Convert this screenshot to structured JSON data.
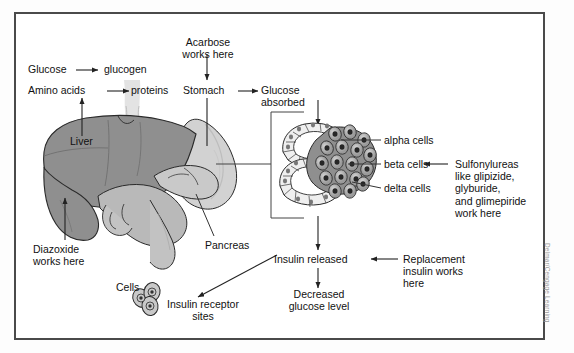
{
  "figure": {
    "credit": "Delmar/Cengage Learning",
    "border_color": "#4a4a4a",
    "background": "#ffffff"
  },
  "palette": {
    "liver": "#8f8f8f",
    "stomach_light": "#d9d9d9",
    "stomach_mid": "#c4c4c4",
    "intestine": "#bdbdbd",
    "islet_light": "#efefef",
    "islet_dark": "#8c8c8c",
    "outline": "#2a2a2a",
    "text": "#111111",
    "arrow": "#222222"
  },
  "labels": {
    "acarbose": "Acarbose\nworks here",
    "glucose": "Glucose",
    "glucogen": "glucogen",
    "amino_acids": "Amino acids",
    "proteins": "proteins",
    "stomach": "Stomach",
    "glucose_absorbed": "Glucose\nabsorbed",
    "liver": "Liver",
    "pancreas": "Pancreas",
    "diazoxide": "Diazoxide\nworks here",
    "alpha_cells": "alpha cells",
    "beta_cells": "beta cells",
    "delta_cells": "delta cells",
    "sulfonylureas": "Sulfonylureas\nlike glipizide,\nglyburide,\nand glimepiride\nwork here",
    "insulin_released": "Insulin released",
    "replacement_insulin": "Replacement\ninsulin works\nhere",
    "decreased_glucose": "Decreased\nglucose level",
    "cells": "Cells",
    "insulin_receptor_sites": "Insulin receptor\nsites"
  },
  "flow": [
    {
      "from": "Glucose",
      "to": "glucogen"
    },
    {
      "from": "Amino acids",
      "to": "proteins"
    },
    {
      "from": "Liver",
      "to": "Amino acids"
    },
    {
      "from": "Diazoxide works here",
      "to": "Liver"
    },
    {
      "from": "Acarbose works here",
      "to": "Stomach"
    },
    {
      "from": "Stomach",
      "to": "Glucose absorbed"
    },
    {
      "from": "Glucose absorbed",
      "to": "Islet of Langerhans"
    },
    {
      "from": "Islet of Langerhans",
      "to": "Insulin released"
    },
    {
      "from": "Sulfonylureas like glipizide, glyburide, and glimepiride work here",
      "to": "beta cells"
    },
    {
      "from": "Replacement insulin works here",
      "to": "Insulin released"
    },
    {
      "from": "Insulin released",
      "to": "Decreased glucose level"
    },
    {
      "from": "Insulin released",
      "to": "Insulin receptor sites"
    }
  ],
  "cell_types": [
    "alpha cells",
    "beta cells",
    "delta cells"
  ],
  "drugs": [
    "Acarbose",
    "Diazoxide",
    "Sulfonylureas",
    "glipizide",
    "glyburide",
    "glimepiride",
    "Replacement insulin"
  ]
}
